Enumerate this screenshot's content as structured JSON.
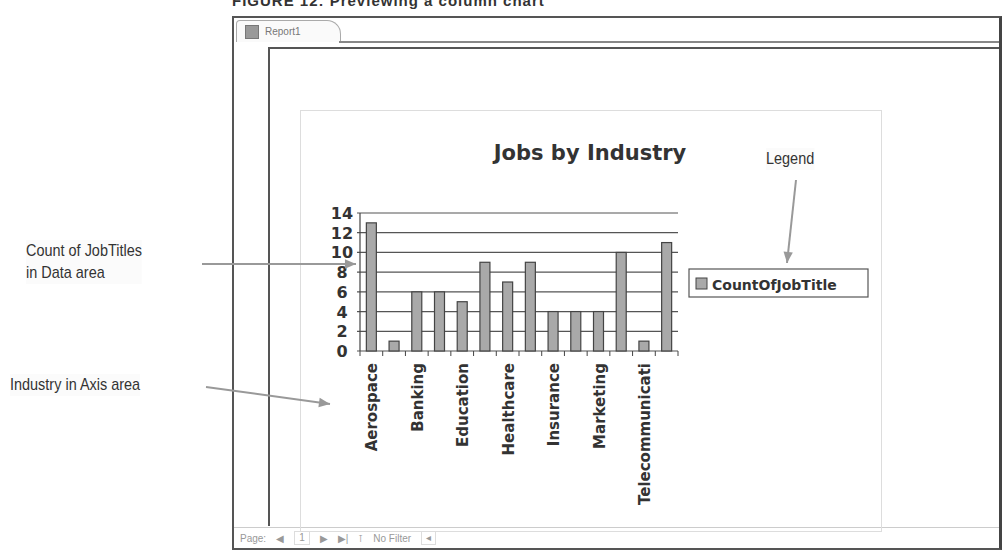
{
  "figure_caption_partial": "FIGURE 12: Previewing a column chart",
  "window": {
    "tab_label": "Report1",
    "tab_icon": "report-icon"
  },
  "statusbar": {
    "page_label": "Page:",
    "page_number": "1",
    "filter_label": "No Filter"
  },
  "callouts": {
    "data_area": [
      "Count of JobTitles",
      "in Data area"
    ],
    "axis_area": "Industry in Axis area",
    "legend": "Legend"
  },
  "colors": {
    "bar_fill": "#a9a9a9",
    "bar_stroke": "#444444",
    "grid": "#555555",
    "arrow": "#999999"
  },
  "chart_data": {
    "type": "bar",
    "title": "Jobs by Industry",
    "xlabel": "",
    "ylabel": "",
    "categories": [
      "Aerospace",
      "(unlabeled 2)",
      "Banking",
      "(unlabeled 4)",
      "Education",
      "(unlabeled 6)",
      "Healthcare",
      "(unlabeled 8)",
      "Insurance",
      "(unlabeled 10)",
      "Marketing",
      "(unlabeled 12)",
      "Telecommunicati",
      "(unlabeled 14)"
    ],
    "visible_tick_labels": [
      "Aerospace",
      "Banking",
      "Education",
      "Healthcare",
      "Insurance",
      "Marketing",
      "Telecommunicati"
    ],
    "series": [
      {
        "name": "CountOfJobTitle",
        "values": [
          13,
          1,
          6,
          6,
          5,
          9,
          7,
          9,
          4,
          4,
          4,
          10,
          1,
          11
        ]
      }
    ],
    "yticks": [
      0,
      2,
      4,
      6,
      8,
      10,
      12,
      14
    ],
    "ylim": [
      0,
      14
    ],
    "grid": true,
    "legend_position": "right"
  }
}
